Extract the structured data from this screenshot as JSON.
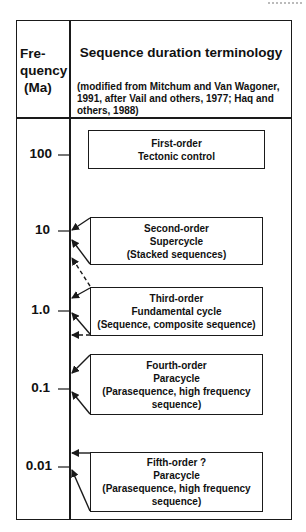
{
  "header": {
    "frequency_label": [
      "Fre-",
      "quency",
      "(Ma)"
    ],
    "title": "Sequence duration terminology",
    "subtitle": "(modified from Mitchum and Van Wagoner, 1991, after Vail and others, 1977; Haq and others, 1988)"
  },
  "axis": {
    "ticks": [
      {
        "label": "100",
        "y": 155
      },
      {
        "label": "10",
        "y": 231
      },
      {
        "label": "1.0",
        "y": 311
      },
      {
        "label": "0.1",
        "y": 389
      },
      {
        "label": "0.01",
        "y": 467
      }
    ]
  },
  "boxes": [
    {
      "order": "First-order",
      "lines": [
        "First-order",
        "Tectonic control"
      ]
    },
    {
      "order": "Second-order",
      "lines": [
        "Second-order",
        "Supercycle",
        "(Stacked sequences)"
      ]
    },
    {
      "order": "Third-order",
      "lines": [
        "Third-order",
        "Fundamental cycle",
        "(Sequence, composite sequence)"
      ]
    },
    {
      "order": "Fourth-order",
      "lines": [
        "Fourth-order",
        "Paracycle",
        "(Parasequence, high frequency",
        "sequence)"
      ]
    },
    {
      "order": "Fifth-order",
      "lines": [
        "Fifth-order ?",
        "Paracycle",
        "(Parasequence, high frequency",
        "sequence)"
      ]
    }
  ],
  "colors": {
    "line": "#1a1a1a",
    "background": "#ffffff"
  }
}
